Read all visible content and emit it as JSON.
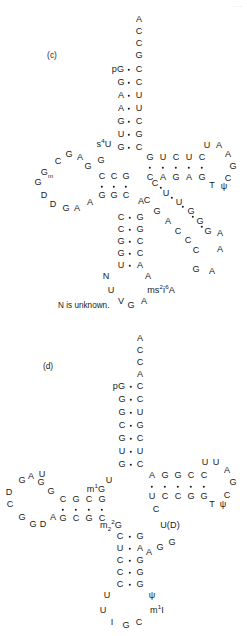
{
  "figure": {
    "type": "trna-cloverleaf-secondary-structure",
    "page_mark": "....",
    "panels": [
      {
        "id": "c",
        "label": "(c)",
        "label_pos": [
          52,
          55
        ],
        "note": "N is unknown.",
        "note_pos": [
          58,
          302
        ],
        "residues": [
          {
            "t": "A",
            "x": 139,
            "y": 20
          },
          {
            "t": "C",
            "x": 139,
            "y": 32
          },
          {
            "t": "C",
            "x": 139,
            "y": 44
          },
          {
            "t": "G",
            "x": 139,
            "y": 56
          },
          {
            "t": "pG",
            "x": 118,
            "y": 70
          },
          {
            "t": "C",
            "x": 139,
            "y": 70
          },
          {
            "t": "G",
            "x": 121,
            "y": 83
          },
          {
            "t": "C",
            "x": 139,
            "y": 83
          },
          {
            "t": "A",
            "x": 121,
            "y": 96
          },
          {
            "t": "U",
            "x": 139,
            "y": 96
          },
          {
            "t": "A",
            "x": 121,
            "y": 109
          },
          {
            "t": "U",
            "x": 139,
            "y": 109
          },
          {
            "t": "G",
            "x": 121,
            "y": 122
          },
          {
            "t": "C",
            "x": 139,
            "y": 122
          },
          {
            "t": "U",
            "x": 121,
            "y": 135
          },
          {
            "t": "G",
            "x": 139,
            "y": 135
          },
          {
            "t": "G",
            "x": 121,
            "y": 148
          },
          {
            "t": "C",
            "x": 139,
            "y": 148
          },
          {
            "t": "s4U",
            "html": "s<sup>4</sup>U",
            "x": 104,
            "y": 145
          },
          {
            "t": "G",
            "x": 101,
            "y": 161
          },
          {
            "t": "G",
            "x": 150,
            "y": 158
          },
          {
            "t": "U",
            "x": 163,
            "y": 158
          },
          {
            "t": "C",
            "x": 176,
            "y": 158
          },
          {
            "t": "U",
            "x": 189,
            "y": 158
          },
          {
            "t": "C",
            "x": 202,
            "y": 158
          },
          {
            "t": "U",
            "x": 207,
            "y": 146
          },
          {
            "t": "A",
            "x": 219,
            "y": 146
          },
          {
            "t": "A",
            "x": 228,
            "y": 155
          },
          {
            "t": "G",
            "x": 233,
            "y": 167
          },
          {
            "t": "C",
            "x": 228,
            "y": 179
          },
          {
            "t": "C",
            "x": 150,
            "y": 178
          },
          {
            "t": "A",
            "x": 163,
            "y": 178
          },
          {
            "t": "G",
            "x": 176,
            "y": 178
          },
          {
            "t": "A",
            "x": 189,
            "y": 178
          },
          {
            "t": "G",
            "x": 202,
            "y": 178
          },
          {
            "t": "T",
            "x": 212,
            "y": 186
          },
          {
            "t": "psi",
            "html": "&#968;",
            "x": 224,
            "y": 187
          },
          {
            "t": "C",
            "x": 102,
            "y": 177
          },
          {
            "t": "C",
            "x": 114,
            "y": 177
          },
          {
            "t": "G",
            "x": 126,
            "y": 177
          },
          {
            "t": "G",
            "x": 102,
            "y": 196
          },
          {
            "t": "G",
            "x": 114,
            "y": 196
          },
          {
            "t": "C",
            "x": 126,
            "y": 196
          },
          {
            "t": "G",
            "x": 88,
            "y": 167
          },
          {
            "t": "A",
            "x": 80,
            "y": 158
          },
          {
            "t": "G",
            "x": 69,
            "y": 155
          },
          {
            "t": "C",
            "x": 58,
            "y": 162
          },
          {
            "t": "Gm",
            "html": "G<sub>m</sub>",
            "x": 47,
            "y": 173
          },
          {
            "t": "G",
            "x": 38,
            "y": 183
          },
          {
            "t": "D",
            "x": 44,
            "y": 196
          },
          {
            "t": "D",
            "x": 53,
            "y": 205
          },
          {
            "t": "G",
            "x": 66,
            "y": 209
          },
          {
            "t": "A",
            "x": 77,
            "y": 209
          },
          {
            "t": "A",
            "x": 90,
            "y": 203
          },
          {
            "t": "A",
            "x": 141,
            "y": 202
          },
          {
            "t": "C",
            "x": 155,
            "y": 184
          },
          {
            "t": "C",
            "x": 147,
            "y": 201
          },
          {
            "t": "U",
            "x": 166,
            "y": 194
          },
          {
            "t": "G",
            "x": 157,
            "y": 212
          },
          {
            "t": "U",
            "x": 179,
            "y": 203
          },
          {
            "t": "A",
            "x": 168,
            "y": 222
          },
          {
            "t": "G",
            "x": 191,
            "y": 212
          },
          {
            "t": "C",
            "x": 178,
            "y": 232
          },
          {
            "t": "G",
            "x": 200,
            "y": 222
          },
          {
            "t": "C",
            "x": 188,
            "y": 241
          },
          {
            "t": "G",
            "x": 208,
            "y": 232
          },
          {
            "t": "C",
            "x": 196,
            "y": 251
          },
          {
            "t": "A",
            "x": 220,
            "y": 234
          },
          {
            "t": "A",
            "x": 220,
            "y": 250
          },
          {
            "t": "G",
            "x": 196,
            "y": 270
          },
          {
            "t": "A",
            "x": 212,
            "y": 272
          },
          {
            "t": "C",
            "x": 121,
            "y": 218
          },
          {
            "t": "G",
            "x": 140,
            "y": 218
          },
          {
            "t": "C",
            "x": 121,
            "y": 230
          },
          {
            "t": "G",
            "x": 140,
            "y": 230
          },
          {
            "t": "G",
            "x": 121,
            "y": 242
          },
          {
            "t": "C",
            "x": 140,
            "y": 242
          },
          {
            "t": "G",
            "x": 121,
            "y": 254
          },
          {
            "t": "C",
            "x": 140,
            "y": 254
          },
          {
            "t": "U",
            "x": 121,
            "y": 266
          },
          {
            "t": "A",
            "x": 140,
            "y": 266
          },
          {
            "t": "N",
            "x": 106,
            "y": 277
          },
          {
            "t": "A",
            "x": 148,
            "y": 277
          },
          {
            "t": "U",
            "x": 111,
            "y": 291
          },
          {
            "t": "ms2i6A",
            "html": "ms<sup>2</sup>i<sup>6</sup>A",
            "x": 161,
            "y": 291
          },
          {
            "t": "V",
            "x": 121,
            "y": 302
          },
          {
            "t": "G",
            "x": 131,
            "y": 306
          },
          {
            "t": "A",
            "x": 144,
            "y": 302
          }
        ],
        "bonds": [
          {
            "x": 129,
            "y": 70
          },
          {
            "x": 129,
            "y": 83
          },
          {
            "x": 129,
            "y": 96
          },
          {
            "x": 129,
            "y": 109
          },
          {
            "x": 129,
            "y": 122
          },
          {
            "x": 129,
            "y": 135
          },
          {
            "x": 129,
            "y": 148
          },
          {
            "x": 150,
            "y": 168
          },
          {
            "x": 163,
            "y": 168
          },
          {
            "x": 176,
            "y": 168
          },
          {
            "x": 189,
            "y": 168
          },
          {
            "x": 202,
            "y": 168
          },
          {
            "x": 102,
            "y": 187
          },
          {
            "x": 114,
            "y": 187
          },
          {
            "x": 126,
            "y": 187
          },
          {
            "x": 130,
            "y": 218
          },
          {
            "x": 130,
            "y": 230
          },
          {
            "x": 130,
            "y": 242
          },
          {
            "x": 130,
            "y": 254
          },
          {
            "x": 130,
            "y": 266
          },
          {
            "x": 161,
            "y": 188
          },
          {
            "x": 172,
            "y": 198
          },
          {
            "x": 183,
            "y": 207
          },
          {
            "x": 193,
            "y": 217
          },
          {
            "x": 202,
            "y": 227
          }
        ]
      },
      {
        "id": "d",
        "label": "(d)",
        "label_pos": [
          48,
          46
        ],
        "note": "",
        "note_pos": [
          0,
          0
        ],
        "residues": [
          {
            "t": "A",
            "x": 140,
            "y": 19
          },
          {
            "t": "C",
            "x": 140,
            "y": 31
          },
          {
            "t": "C",
            "x": 140,
            "y": 43
          },
          {
            "t": "A",
            "x": 140,
            "y": 55
          },
          {
            "t": "pG",
            "x": 119,
            "y": 67
          },
          {
            "t": "C",
            "x": 140,
            "y": 67
          },
          {
            "t": "G",
            "x": 122,
            "y": 80
          },
          {
            "t": "C",
            "x": 140,
            "y": 80
          },
          {
            "t": "G",
            "x": 122,
            "y": 93
          },
          {
            "t": "U",
            "x": 140,
            "y": 93
          },
          {
            "t": "C",
            "x": 122,
            "y": 106
          },
          {
            "t": "G",
            "x": 140,
            "y": 106
          },
          {
            "t": "G",
            "x": 122,
            "y": 119
          },
          {
            "t": "C",
            "x": 140,
            "y": 119
          },
          {
            "t": "U",
            "x": 122,
            "y": 132
          },
          {
            "t": "U",
            "x": 140,
            "y": 132
          },
          {
            "t": "G",
            "x": 122,
            "y": 145
          },
          {
            "t": "C",
            "x": 140,
            "y": 145
          },
          {
            "t": "U",
            "x": 109,
            "y": 161
          },
          {
            "t": "A",
            "x": 152,
            "y": 156
          },
          {
            "t": "G",
            "x": 165,
            "y": 156
          },
          {
            "t": "G",
            "x": 178,
            "y": 156
          },
          {
            "t": "C",
            "x": 191,
            "y": 156
          },
          {
            "t": "C",
            "x": 204,
            "y": 156
          },
          {
            "t": "U",
            "x": 205,
            "y": 143
          },
          {
            "t": "U",
            "x": 216,
            "y": 143
          },
          {
            "t": "A",
            "x": 227,
            "y": 151
          },
          {
            "t": "G",
            "x": 233,
            "y": 163
          },
          {
            "t": "C",
            "x": 227,
            "y": 176
          },
          {
            "t": "U",
            "x": 152,
            "y": 177
          },
          {
            "t": "C",
            "x": 165,
            "y": 177
          },
          {
            "t": "C",
            "x": 178,
            "y": 177
          },
          {
            "t": "G",
            "x": 191,
            "y": 177
          },
          {
            "t": "G",
            "x": 204,
            "y": 177
          },
          {
            "t": "T",
            "x": 212,
            "y": 185
          },
          {
            "t": "psi",
            "html": "&#968;",
            "x": 223,
            "y": 185
          },
          {
            "t": "C",
            "x": 156,
            "y": 190
          },
          {
            "t": "U(D)",
            "html": "U(D)",
            "x": 170,
            "y": 206
          },
          {
            "t": "G",
            "x": 172,
            "y": 223
          },
          {
            "t": "G",
            "x": 160,
            "y": 228
          },
          {
            "t": "A",
            "x": 149,
            "y": 233
          },
          {
            "t": "m1G",
            "html": "m<sup>1</sup>G",
            "x": 96,
            "y": 170
          },
          {
            "t": "C",
            "x": 63,
            "y": 180
          },
          {
            "t": "G",
            "x": 76,
            "y": 180
          },
          {
            "t": "C",
            "x": 89,
            "y": 180
          },
          {
            "t": "G",
            "x": 102,
            "y": 180
          },
          {
            "t": "G",
            "x": 63,
            "y": 199
          },
          {
            "t": "C",
            "x": 76,
            "y": 199
          },
          {
            "t": "G",
            "x": 89,
            "y": 199
          },
          {
            "t": "C",
            "x": 102,
            "y": 199
          },
          {
            "t": "G",
            "x": 51,
            "y": 172
          },
          {
            "t": "G",
            "x": 41,
            "y": 163
          },
          {
            "t": "A",
            "x": 31,
            "y": 157
          },
          {
            "t": "U",
            "x": 42,
            "y": 155
          },
          {
            "t": "G",
            "x": 22,
            "y": 161
          },
          {
            "t": "D",
            "x": 9,
            "y": 173
          },
          {
            "t": "C",
            "x": 10,
            "y": 185
          },
          {
            "t": "G",
            "x": 22,
            "y": 198
          },
          {
            "t": "G",
            "x": 33,
            "y": 205
          },
          {
            "t": "D",
            "x": 43,
            "y": 205
          },
          {
            "t": "A",
            "x": 53,
            "y": 198
          },
          {
            "t": "m22G",
            "html": "m<sub>2</sub><sup>2</sup>G",
            "x": 111,
            "y": 206
          },
          {
            "t": "C",
            "x": 120,
            "y": 217
          },
          {
            "t": "G",
            "x": 140,
            "y": 217
          },
          {
            "t": "U",
            "x": 120,
            "y": 229
          },
          {
            "t": "A",
            "x": 140,
            "y": 229
          },
          {
            "t": "C",
            "x": 120,
            "y": 241
          },
          {
            "t": "G",
            "x": 140,
            "y": 241
          },
          {
            "t": "C",
            "x": 120,
            "y": 253
          },
          {
            "t": "G",
            "x": 140,
            "y": 253
          },
          {
            "t": "C",
            "x": 120,
            "y": 265
          },
          {
            "t": "G",
            "x": 140,
            "y": 265
          },
          {
            "t": "U",
            "x": 107,
            "y": 276
          },
          {
            "t": "psi",
            "html": "&#968;",
            "x": 152,
            "y": 276
          },
          {
            "t": "U",
            "x": 103,
            "y": 291
          },
          {
            "t": "m1I",
            "html": "m<sup>1</sup>I",
            "x": 157,
            "y": 291
          },
          {
            "t": "I",
            "x": 112,
            "y": 303
          },
          {
            "t": "G",
            "x": 126,
            "y": 306
          },
          {
            "t": "C",
            "x": 139,
            "y": 303
          }
        ],
        "bonds": [
          {
            "x": 131,
            "y": 67
          },
          {
            "x": 131,
            "y": 80
          },
          {
            "x": 131,
            "y": 93
          },
          {
            "x": 131,
            "y": 106
          },
          {
            "x": 131,
            "y": 119
          },
          {
            "x": 131,
            "y": 132
          },
          {
            "x": 131,
            "y": 145
          },
          {
            "x": 152,
            "y": 167
          },
          {
            "x": 165,
            "y": 167
          },
          {
            "x": 178,
            "y": 167
          },
          {
            "x": 191,
            "y": 167
          },
          {
            "x": 204,
            "y": 167
          },
          {
            "x": 63,
            "y": 190
          },
          {
            "x": 76,
            "y": 190
          },
          {
            "x": 89,
            "y": 190
          },
          {
            "x": 102,
            "y": 190
          },
          {
            "x": 130,
            "y": 217
          },
          {
            "x": 130,
            "y": 229
          },
          {
            "x": 130,
            "y": 241
          },
          {
            "x": 130,
            "y": 253
          },
          {
            "x": 130,
            "y": 265
          }
        ]
      }
    ]
  }
}
